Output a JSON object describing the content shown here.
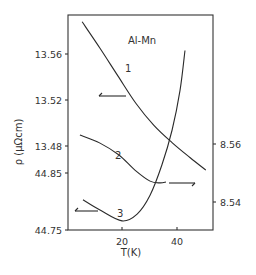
{
  "chart_data": {
    "type": "line",
    "title": "Al-Mn",
    "xlabel": "T(K)",
    "ylabel": "ρ (μΩcm)",
    "xlim": [
      0,
      53
    ],
    "x_ticks": [
      20,
      40
    ],
    "x_tick_labels": [
      "20",
      "40"
    ],
    "left_axis_segments": [
      {
        "ticks": [
          13.56,
          13.52,
          13.48
        ],
        "tick_labels": [
          "13.56",
          "13.52",
          "13.48"
        ],
        "used_by": "1"
      },
      {
        "ticks": [
          44.85,
          44.75
        ],
        "tick_labels": [
          "44.85",
          "44.75"
        ],
        "used_by": "3"
      }
    ],
    "right_axis": {
      "ticks": [
        8.56,
        8.54
      ],
      "tick_labels": [
        "8.56",
        "8.54"
      ],
      "used_by": "2"
    },
    "series": [
      {
        "name": "1",
        "axis": "left-upper",
        "arrow": "left",
        "x": [
          5.5,
          12,
          18.5,
          25.1,
          31.6,
          38.2,
          44.7,
          50.5
        ],
        "values": [
          13.588,
          13.565,
          13.541,
          13.517,
          13.498,
          13.483,
          13.47,
          13.459
        ]
      },
      {
        "name": "2",
        "axis": "right",
        "arrow": "right",
        "x": [
          4.7,
          12,
          18.9,
          24.7,
          30.2,
          33.8,
          36
        ],
        "values": [
          8.5631,
          8.5603,
          8.5562,
          8.551,
          8.5472,
          8.5466,
          8.5469
        ]
      },
      {
        "name": "3",
        "axis": "left-lower",
        "arrow": "left",
        "x": [
          5.8,
          12,
          20,
          25.5,
          30.2,
          34.5,
          38.2,
          41.1,
          42.9
        ],
        "values": [
          44.803,
          44.785,
          44.766,
          44.778,
          44.811,
          44.864,
          44.925,
          44.995,
          45.065
        ]
      }
    ],
    "annotations": [
      "Al-Mn",
      "1",
      "2",
      "3"
    ],
    "grid": false,
    "legend": "none"
  },
  "layout": {
    "plot": {
      "left": 68,
      "top": 15,
      "right": 213,
      "bottom": 230
    },
    "x_origin_px": 67,
    "x_px_per_unit": 2.75,
    "left_upper": {
      "ref_value": 13.56,
      "ref_px": 54,
      "px_per_unit": 1150
    },
    "left_lower": {
      "ref_value": 44.85,
      "ref_px": 173,
      "px_per_unit": 570
    },
    "right": {
      "ref_value": 8.56,
      "ref_px": 144,
      "px_per_unit": 2900
    }
  }
}
